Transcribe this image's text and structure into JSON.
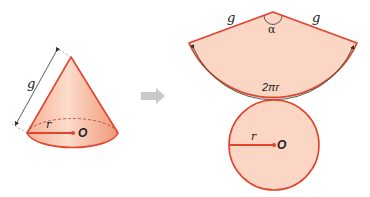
{
  "diagram": {
    "colors": {
      "fill_light": "#fbd9c8",
      "fill_mid": "#f4a98a",
      "outline": "#e0452f",
      "dimension": "#333333",
      "arrow": "#cccccc"
    },
    "cone": {
      "slant_label": "g",
      "radius_label": "r",
      "center_label": "O"
    },
    "arrow": {
      "icon": "right-arrow-icon"
    },
    "net": {
      "sector": {
        "left_side_label": "g",
        "right_side_label": "g",
        "angle_label": "α",
        "arc_label": "2πr"
      },
      "base_circle": {
        "radius_label": "r",
        "center_label": "O"
      }
    }
  }
}
